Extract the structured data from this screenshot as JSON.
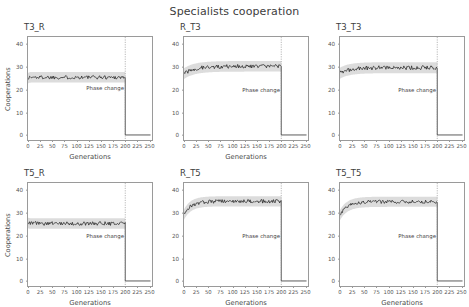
{
  "figure": {
    "suptitle": "Specialists cooperation",
    "xlabel": "Generations",
    "ylabel": "Cooperations",
    "annotation": "Phase change",
    "line_color": "#262626",
    "band_color": "#bfbfbf",
    "vline_color": "#8a8a8a",
    "frame_color": "#9a9a9a",
    "background": "#ffffff"
  },
  "chart_data": [
    {
      "type": "line",
      "title": "T3_R",
      "xlabel": "Generations",
      "ylabel": "Cooperations",
      "xlim": [
        0,
        255
      ],
      "ylim": [
        -2,
        43
      ],
      "xticks": [
        0,
        25,
        50,
        75,
        100,
        125,
        150,
        175,
        200,
        225,
        250
      ],
      "yticks": [
        0,
        10,
        20,
        30,
        40
      ],
      "grid": false,
      "legend": "none",
      "annotations": [
        {
          "text": "Phase change",
          "x": 120,
          "y": 22
        }
      ],
      "vline": {
        "x": 200,
        "style": "dotted"
      },
      "series": [
        {
          "name": "mean cooperations",
          "start_value": 25.0,
          "plateau_value": 25.4,
          "rise_rate": 0.5,
          "noise": 0.85,
          "phase_change_x": 200,
          "post_value": 0.2
        }
      ]
    },
    {
      "type": "line",
      "title": "R_T3",
      "xlabel": "Generations",
      "ylabel": "",
      "xlim": [
        0,
        255
      ],
      "ylim": [
        -2,
        43
      ],
      "xticks": [
        0,
        25,
        50,
        75,
        100,
        125,
        150,
        175,
        200,
        225,
        250
      ],
      "yticks": [
        0,
        10,
        20,
        30,
        40
      ],
      "grid": false,
      "legend": "none",
      "annotations": [
        {
          "text": "Phase change",
          "x": 120,
          "y": 21
        }
      ],
      "vline": {
        "x": 200,
        "style": "dotted"
      },
      "series": [
        {
          "name": "mean cooperations",
          "start_value": 27.0,
          "plateau_value": 30.2,
          "rise_rate": 0.045,
          "noise": 0.85,
          "phase_change_x": 200,
          "post_value": 0.2
        }
      ]
    },
    {
      "type": "line",
      "title": "T3_T3",
      "xlabel": "",
      "ylabel": "",
      "xlim": [
        0,
        255
      ],
      "ylim": [
        -2,
        43
      ],
      "xticks": [
        0,
        25,
        50,
        75,
        100,
        125,
        150,
        175,
        200,
        225,
        250
      ],
      "yticks": [
        0,
        10,
        20,
        30,
        40
      ],
      "grid": false,
      "legend": "none",
      "annotations": [
        {
          "text": "Phase change",
          "x": 120,
          "y": 21
        }
      ],
      "vline": {
        "x": 200,
        "style": "dotted"
      },
      "series": [
        {
          "name": "mean cooperations",
          "start_value": 27.2,
          "plateau_value": 29.6,
          "rise_rate": 0.05,
          "noise": 0.9,
          "phase_change_x": 200,
          "post_value": 0.2
        }
      ]
    },
    {
      "type": "line",
      "title": "T5_R",
      "xlabel": "Generations",
      "ylabel": "Cooperations",
      "xlim": [
        0,
        255
      ],
      "ylim": [
        -2,
        43
      ],
      "xticks": [
        0,
        25,
        50,
        75,
        100,
        125,
        150,
        175,
        200,
        225,
        250
      ],
      "yticks": [
        0,
        10,
        20,
        30,
        40
      ],
      "grid": false,
      "legend": "none",
      "annotations": [
        {
          "text": "Phase change",
          "x": 120,
          "y": 21
        }
      ],
      "vline": {
        "x": 200,
        "style": "dotted"
      },
      "series": [
        {
          "name": "mean cooperations",
          "start_value": 25.6,
          "plateau_value": 25.3,
          "rise_rate": 0.5,
          "noise": 0.85,
          "phase_change_x": 200,
          "post_value": 0.2
        }
      ]
    },
    {
      "type": "line",
      "title": "R_T5",
      "xlabel": "Generations",
      "ylabel": "",
      "xlim": [
        0,
        255
      ],
      "ylim": [
        -2,
        43
      ],
      "xticks": [
        0,
        25,
        50,
        75,
        100,
        125,
        150,
        175,
        200,
        225,
        250
      ],
      "yticks": [
        0,
        10,
        20,
        30,
        40
      ],
      "grid": false,
      "legend": "none",
      "annotations": [
        {
          "text": "Phase change",
          "x": 120,
          "y": 21
        }
      ],
      "vline": {
        "x": 200,
        "style": "dotted"
      },
      "series": [
        {
          "name": "mean cooperations",
          "start_value": 29.2,
          "plateau_value": 35.0,
          "rise_rate": 0.07,
          "noise": 0.8,
          "phase_change_x": 200,
          "post_value": 0.2
        }
      ]
    },
    {
      "type": "line",
      "title": "T5_T5",
      "xlabel": "Generations",
      "ylabel": "",
      "xlim": [
        0,
        255
      ],
      "ylim": [
        -2,
        43
      ],
      "xticks": [
        0,
        25,
        50,
        75,
        100,
        125,
        150,
        175,
        200,
        225,
        250
      ],
      "yticks": [
        0,
        10,
        20,
        30,
        40
      ],
      "grid": false,
      "legend": "none",
      "annotations": [
        {
          "text": "Phase change",
          "x": 120,
          "y": 21
        }
      ],
      "vline": {
        "x": 200,
        "style": "dotted"
      },
      "series": [
        {
          "name": "mean cooperations",
          "start_value": 29.0,
          "plateau_value": 34.8,
          "rise_rate": 0.065,
          "noise": 0.8,
          "phase_change_x": 200,
          "post_value": 0.2
        }
      ]
    }
  ]
}
